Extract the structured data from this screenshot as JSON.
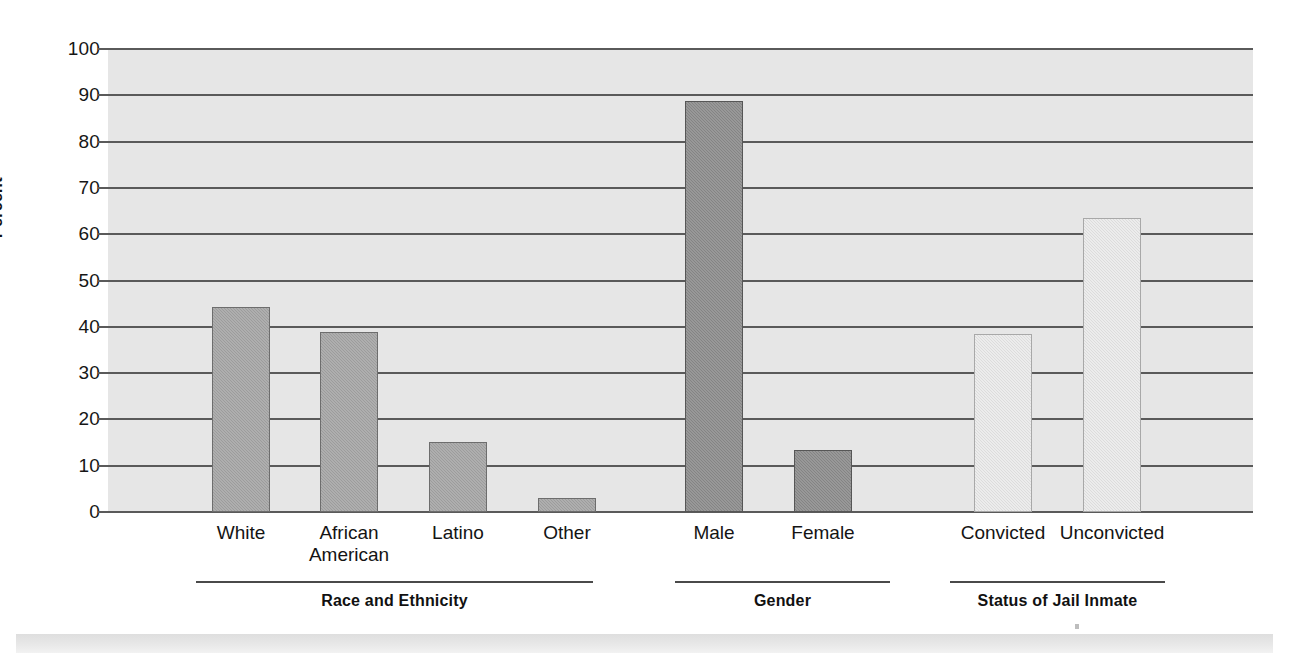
{
  "chart_data": {
    "type": "bar",
    "title": "",
    "xlabel": "",
    "ylabel": "Percent",
    "ylim": [
      0,
      100
    ],
    "ytick_values": [
      100,
      90,
      80,
      70,
      60,
      50,
      40,
      30,
      20,
      10,
      0
    ],
    "ytick_labels": [
      "100",
      "90",
      "80",
      "70",
      "60",
      "50",
      "40",
      "30",
      "20",
      "10",
      "0"
    ],
    "grid": true,
    "legend": "none",
    "categories": [
      "White",
      "African American",
      "Latino",
      "Other",
      "Male",
      "Female",
      "Convicted",
      "Unconvicted"
    ],
    "values": [
      44.3,
      38.9,
      15.1,
      3.0,
      88.7,
      13.4,
      38.5,
      63.5
    ],
    "groups": [
      {
        "heading": "Race and Ethnicity",
        "bar_color": "#9c9c9c",
        "bars": [
          {
            "label": "White",
            "value": 44.3
          },
          {
            "label": "African\nAmerican",
            "value": 38.9
          },
          {
            "label": "Latino",
            "value": 15.1
          },
          {
            "label": "Other",
            "value": 3.0
          }
        ]
      },
      {
        "heading": "Gender",
        "bar_color": "#848484",
        "bars": [
          {
            "label": "Male",
            "value": 88.7
          },
          {
            "label": "Female",
            "value": 13.4
          }
        ]
      },
      {
        "heading": "Status of Jail Inmate",
        "bar_color": "#dcdcdc",
        "bars": [
          {
            "label": "Convicted",
            "value": 38.5
          },
          {
            "label": "Unconvicted",
            "value": 63.5
          }
        ]
      }
    ]
  },
  "colors": {
    "plot_background": "#e6e6e6",
    "gridline": "#5a5a5a",
    "text": "#141414",
    "group_one_bar": "#9c9c9c",
    "group_two_bar": "#848484",
    "group_three_bar": "#dcdcdc"
  }
}
